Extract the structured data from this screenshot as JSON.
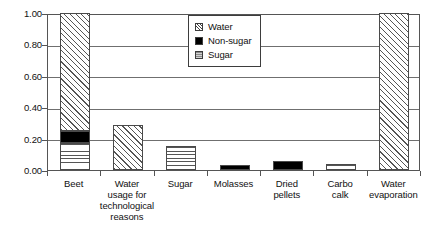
{
  "chart_data": {
    "type": "bar",
    "title": "",
    "subtitle": "",
    "xlabel": "",
    "ylabel": "",
    "stacked": true,
    "grid": true,
    "ylim": [
      0.0,
      1.0
    ],
    "ytick_labels": [
      "1.00",
      "0.80",
      "0.60",
      "0.40",
      "0.20",
      "0.00"
    ],
    "ytick_values": [
      1.0,
      0.8,
      0.6,
      0.4,
      0.2,
      0.0
    ],
    "legend_position": "top-right-inside",
    "categories": [
      "Beet",
      "Water usage for technological reasons",
      "Sugar",
      "Molasses",
      "Dried pellets",
      "Carbo calk",
      "Water evaporation"
    ],
    "category_lines": [
      [
        "Beet"
      ],
      [
        "Water",
        "usage for",
        "technological",
        "reasons"
      ],
      [
        "Sugar"
      ],
      [
        "Molasses"
      ],
      [
        "Dried",
        "pellets"
      ],
      [
        "Carbo",
        "calk"
      ],
      [
        "Water",
        "evaporation"
      ]
    ],
    "series": [
      {
        "name": "Sugar",
        "pattern": "horizontal-lines",
        "values": [
          0.17,
          0.0,
          0.155,
          0.0,
          0.0,
          0.04,
          0.0
        ]
      },
      {
        "name": "Non-sugar",
        "pattern": "solid-black",
        "values": [
          0.08,
          0.0,
          0.0,
          0.03,
          0.06,
          0.0,
          0.0
        ]
      },
      {
        "name": "Water",
        "pattern": "diagonal-hatch",
        "values": [
          0.75,
          0.285,
          0.0,
          0.0,
          0.0,
          0.0,
          1.0
        ]
      }
    ],
    "totals": [
      1.0,
      0.285,
      0.155,
      0.03,
      0.06,
      0.04,
      1.0
    ]
  },
  "legend": {
    "items": [
      {
        "label": "Water",
        "swatch": "hatch-swatch-icon"
      },
      {
        "label": "Non-sugar",
        "swatch": "black-swatch-icon"
      },
      {
        "label": "Sugar",
        "swatch": "gray-swatch-icon"
      }
    ]
  },
  "colors": {
    "axis": "#555555",
    "grid": "#6f6f6f",
    "bar_outline": "#4a4a4a",
    "nonsugar": "#000000",
    "text": "#111111",
    "background": "#ffffff"
  }
}
